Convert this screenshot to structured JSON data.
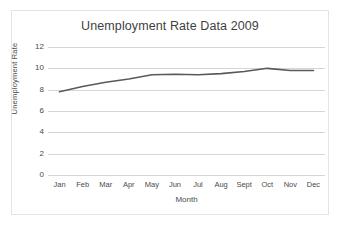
{
  "chart_data": {
    "type": "line",
    "title": "Unemployment Rate Data 2009",
    "xlabel": "Month",
    "ylabel": "Unemployment Rate",
    "categories": [
      "Jan",
      "Feb",
      "Mar",
      "Apr",
      "May",
      "Jun",
      "Jul",
      "Aug",
      "Sept",
      "Oct",
      "Nov",
      "Dec"
    ],
    "values": [
      7.8,
      8.3,
      8.7,
      9.0,
      9.4,
      9.45,
      9.4,
      9.5,
      9.7,
      10.0,
      9.8,
      9.8
    ],
    "series": [
      {
        "name": "Unemployment Rate",
        "values": [
          7.8,
          8.3,
          8.7,
          9.0,
          9.4,
          9.45,
          9.4,
          9.5,
          9.7,
          10.0,
          9.8,
          9.8
        ],
        "color": "#595959"
      }
    ],
    "ylim": [
      0,
      12
    ],
    "yticks": [
      0,
      2,
      4,
      6,
      8,
      10,
      12
    ],
    "ytick_labels": [
      "0",
      "2",
      "4",
      "6",
      "8",
      "10",
      "12"
    ],
    "grid": "horizontal",
    "legend": "none",
    "marker": "none",
    "line_width": 1.6,
    "plot_background": "#ffffff",
    "gridline_color": "#d6d6d6",
    "frame_color": "#e3e3e3",
    "text_color": "#4a4a4a",
    "title_color": "#3f3f3f"
  }
}
